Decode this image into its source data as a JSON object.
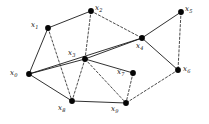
{
  "figure": {
    "background_color": "#ffffff",
    "node_color": "#050505",
    "edge_color": "#1a1a1a",
    "width": 209,
    "height": 124
  },
  "chart_data": {
    "type": "diagram",
    "subtype": "node-link-graph",
    "title": "",
    "node_count": 10,
    "edge_count": 18,
    "nodes": [
      {
        "id": "x0",
        "label": "x",
        "sub": "0",
        "x": 29,
        "y": 74,
        "label_x": 10,
        "label_y": 69
      },
      {
        "id": "x1",
        "label": "x",
        "sub": "1",
        "x": 48,
        "y": 28,
        "label_x": 31,
        "label_y": 21
      },
      {
        "id": "x2",
        "label": "x",
        "sub": "2",
        "x": 91,
        "y": 11,
        "label_x": 95,
        "label_y": 4
      },
      {
        "id": "x3",
        "label": "x",
        "sub": "3",
        "x": 85,
        "y": 59,
        "label_x": 68,
        "label_y": 49
      },
      {
        "id": "x4",
        "label": "x",
        "sub": "4",
        "x": 142,
        "y": 38,
        "label_x": 136,
        "label_y": 42
      },
      {
        "id": "x5",
        "label": "x",
        "sub": "5",
        "x": 181,
        "y": 12,
        "label_x": 185,
        "label_y": 5
      },
      {
        "id": "x6",
        "label": "x",
        "sub": "6",
        "x": 178,
        "y": 70,
        "label_x": 183,
        "label_y": 65
      },
      {
        "id": "x7",
        "label": "x",
        "sub": "7",
        "x": 133,
        "y": 73,
        "label_x": 117,
        "label_y": 68
      },
      {
        "id": "x8",
        "label": "x",
        "sub": "8",
        "x": 72,
        "y": 101,
        "label_x": 58,
        "label_y": 104
      },
      {
        "id": "x9",
        "label": "x",
        "sub": "9",
        "x": 126,
        "y": 103,
        "label_x": 111,
        "label_y": 105
      }
    ],
    "edges": [
      {
        "from": "x0",
        "to": "x1",
        "style": "solid"
      },
      {
        "from": "x0",
        "to": "x3",
        "style": "solid"
      },
      {
        "from": "x0",
        "to": "x4",
        "style": "solid"
      },
      {
        "from": "x0",
        "to": "x8",
        "style": "solid"
      },
      {
        "from": "x1",
        "to": "x2",
        "style": "solid"
      },
      {
        "from": "x1",
        "to": "x8",
        "style": "dashed"
      },
      {
        "from": "x2",
        "to": "x3",
        "style": "dashed"
      },
      {
        "from": "x2",
        "to": "x4",
        "style": "dashed"
      },
      {
        "from": "x3",
        "to": "x4",
        "style": "solid"
      },
      {
        "from": "x3",
        "to": "x7",
        "style": "solid"
      },
      {
        "from": "x3",
        "to": "x8",
        "style": "dashed"
      },
      {
        "from": "x3",
        "to": "x9",
        "style": "dashed"
      },
      {
        "from": "x4",
        "to": "x5",
        "style": "solid"
      },
      {
        "from": "x4",
        "to": "x6",
        "style": "solid"
      },
      {
        "from": "x5",
        "to": "x6",
        "style": "dashed"
      },
      {
        "from": "x6",
        "to": "x9",
        "style": "dashed"
      },
      {
        "from": "x7",
        "to": "x9",
        "style": "dashed"
      },
      {
        "from": "x8",
        "to": "x9",
        "style": "solid"
      }
    ]
  }
}
